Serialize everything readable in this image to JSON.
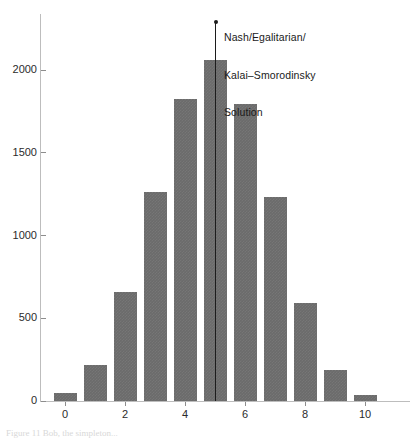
{
  "figure": {
    "background": "#ffffff",
    "bar_color": "#6b6b6b",
    "axis_color": "#bdbdbd",
    "annotation_color": "#1c1c1c",
    "caption_fragment": "Figure 11 Bob, the simpleton..."
  },
  "annotation": {
    "line1": "Nash/Egalitarian/",
    "line2": "Kalai–Smorodinsky",
    "line3": "Solution",
    "at_category": "5"
  },
  "chart_data": {
    "type": "bar",
    "title": "",
    "subtitle": "",
    "xlabel": "",
    "ylabel": "",
    "categories": [
      "0",
      "1",
      "2",
      "3",
      "4",
      "5",
      "6",
      "7",
      "8",
      "9",
      "10"
    ],
    "values": [
      50,
      215,
      660,
      1265,
      1825,
      2060,
      1795,
      1235,
      595,
      190,
      35
    ],
    "xtick_labels": [
      "0",
      "2",
      "4",
      "6",
      "8",
      "10"
    ],
    "xtick_positions": [
      0,
      2,
      4,
      6,
      8,
      10
    ],
    "ytick_labels": [
      "0",
      "500",
      "1000",
      "1500",
      "2000"
    ],
    "ytick_values": [
      0,
      500,
      1000,
      1500,
      2000
    ],
    "ylim": [
      0,
      2200
    ],
    "xlim": [
      -0.6,
      10.6
    ],
    "grid": false,
    "legend": null,
    "annotations": [
      {
        "text": "Nash/Egalitarian/ Kalai–Smorodinsky Solution",
        "x": 5,
        "type": "vertical-line-with-marker"
      }
    ]
  }
}
